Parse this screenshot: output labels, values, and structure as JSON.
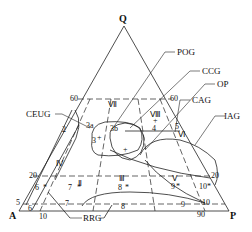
{
  "diagram": {
    "type": "QAP ternary classification diagram",
    "vertices": {
      "top": "Q",
      "left": "A",
      "right": "P"
    },
    "field_labels": [
      {
        "id": "POG",
        "text": "POG"
      },
      {
        "id": "CCG",
        "text": "CCG"
      },
      {
        "id": "OP",
        "text": "OP"
      },
      {
        "id": "CAG",
        "text": "CAG"
      },
      {
        "id": "IAG",
        "text": "IAG"
      },
      {
        "id": "CEUG",
        "text": "CEUG"
      },
      {
        "id": "RRG",
        "text": "RRG"
      }
    ],
    "tick_labels": {
      "left_60": "60",
      "right_60": "60",
      "left_20": "20",
      "right_20": "20",
      "left_5": "5",
      "bottom_10": "10",
      "bottom_90": "90"
    },
    "roman_labels": [
      "Ⅱ",
      "Ⅲ",
      "Ⅳ",
      "Ⅴ",
      "Ⅵ",
      "Ⅶ",
      "Ⅷ",
      "Ⅸ"
    ],
    "field_numbers": [
      "2",
      "3",
      "3a",
      "3b",
      "4",
      "5",
      "6",
      "7",
      "8",
      "9",
      "10"
    ],
    "sample_point_labels": {
      "p2": "2",
      "p3a": "3a",
      "p3": "3",
      "p3b": "3b",
      "p4": "4",
      "p5": "5",
      "p6": "6",
      "p6b": "6",
      "p5b": "5",
      "p7": "7",
      "p7b": "7",
      "p8": "8",
      "p8b": "8",
      "p9": "9",
      "p9b": "9",
      "p10": "10",
      "p10b": "10",
      "r2": "Ⅱ",
      "r3": "Ⅲ",
      "r4": "Ⅳ",
      "r5": "Ⅴ",
      "r6": "Ⅵ",
      "r7": "Ⅶ",
      "r8": "Ⅷ",
      "r9": "Ⅸ"
    }
  }
}
